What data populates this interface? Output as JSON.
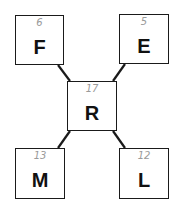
{
  "diagram": {
    "nodes": [
      {
        "id": "F",
        "label": "F",
        "number": "6",
        "x": 15,
        "y": 15,
        "w": 49,
        "h": 50
      },
      {
        "id": "E",
        "label": "E",
        "number": "5",
        "x": 119,
        "y": 14,
        "w": 50,
        "h": 50
      },
      {
        "id": "R",
        "label": "R",
        "number": "17",
        "x": 67,
        "y": 81,
        "w": 50,
        "h": 50
      },
      {
        "id": "M",
        "label": "M",
        "number": "13",
        "x": 15,
        "y": 148,
        "w": 50,
        "h": 51
      },
      {
        "id": "L",
        "label": "L",
        "number": "12",
        "x": 119,
        "y": 148,
        "w": 50,
        "h": 51
      }
    ],
    "edges": [
      {
        "from": "F",
        "to": "R"
      },
      {
        "from": "E",
        "to": "R"
      },
      {
        "from": "M",
        "to": "R"
      },
      {
        "from": "L",
        "to": "R"
      }
    ],
    "colors": {
      "line": "#1a1a1a",
      "number": "#9a9a9a"
    }
  }
}
